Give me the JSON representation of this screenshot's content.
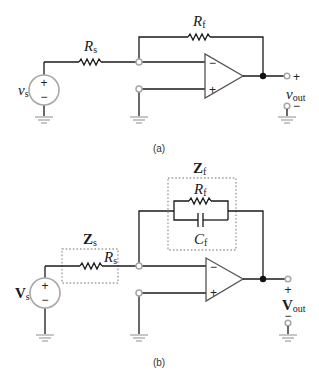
{
  "figure": {
    "a": {
      "caption": "(a)",
      "source_label": "v",
      "source_sub": "s",
      "source_plus": "+",
      "source_minus": "−",
      "rs_label": "R",
      "rs_sub": "s",
      "rf_label": "R",
      "rf_sub": "f",
      "opamp_inv": "−",
      "opamp_noninv": "+",
      "out_plus": "+",
      "out_minus": "−",
      "out_label": "v",
      "out_sub": "out"
    },
    "b": {
      "caption": "(b)",
      "source_label": "V",
      "source_sub": "s",
      "source_plus": "+",
      "source_minus": "−",
      "zs_label": "Z",
      "zs_sub": "s",
      "rs_label": "R",
      "rs_sub": "s",
      "zf_label": "Z",
      "zf_sub": "f",
      "rf_label": "R",
      "rf_sub": "f",
      "cf_label": "C",
      "cf_sub": "f",
      "opamp_inv": "−",
      "opamp_noninv": "+",
      "out_plus": "+",
      "out_minus": "−",
      "out_label": "V",
      "out_sub": "out"
    }
  }
}
